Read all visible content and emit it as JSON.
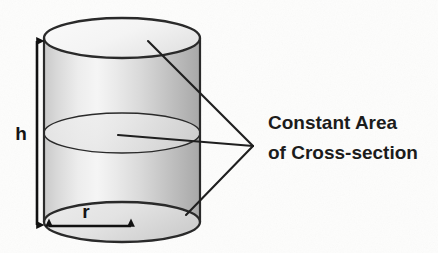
{
  "figure": {
    "kind": "geometry-diagram",
    "background_color": "#fdfdfc",
    "stroke_color": "#2a2a2a",
    "text_color": "#1c1c1c",
    "body_fill_light": "#f2f2f2",
    "body_fill_mid": "#d2d2d2",
    "body_fill_dark": "#a9a9a9",
    "top_face_fill": "#f6f6f6",
    "cross_section_fill": "#e9e9e9"
  },
  "shape": {
    "name": "cylinder",
    "center_x": 122,
    "radius_x": 78,
    "radius_y": 20,
    "top_center_y": 38,
    "bottom_center_y": 222,
    "cross_section_center_y": 133
  },
  "dimensions": [
    {
      "name": "height",
      "label": "h",
      "label_x": 21,
      "label_y": 140,
      "arrow_x": 37,
      "arrow_top_y": 41,
      "arrow_bottom_y": 225,
      "orientation": "vertical"
    },
    {
      "name": "radius",
      "label": "r",
      "label_x": 86,
      "label_y": 218,
      "arrow_y": 226,
      "arrow_left_x": 49,
      "arrow_right_x": 131,
      "orientation": "horizontal"
    }
  ],
  "annotation": {
    "name": "constant-area-callout",
    "lines": [
      "Constant Area",
      "of Cross-section"
    ],
    "line1": "Constant Area",
    "line2": "of Cross-section",
    "text_x": 268,
    "line1_y": 129,
    "line2_y": 159,
    "font_size": 19,
    "converge_x": 253,
    "converge_y": 146,
    "leaders": [
      {
        "name": "leader-to-top-face",
        "x": 148,
        "y": 41
      },
      {
        "name": "leader-to-cross-section",
        "x": 118,
        "y": 135
      },
      {
        "name": "leader-to-bottom-face",
        "x": 186,
        "y": 215
      }
    ]
  }
}
